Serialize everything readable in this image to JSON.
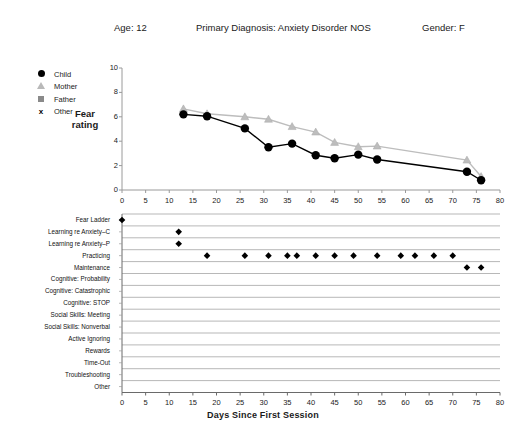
{
  "header": {
    "age": "Age:  12",
    "diagnosis": "Primary Diagnosis:  Anxiety Disorder NOS",
    "gender": "Gender:  F"
  },
  "legend": {
    "items": [
      {
        "label": "Child",
        "marker": "filled-circle",
        "color": "#000000"
      },
      {
        "label": "Mother",
        "marker": "triangle",
        "color": "#bdbdbd"
      },
      {
        "label": "Father",
        "marker": "square",
        "color": "#8a8a8a"
      },
      {
        "label": "Other",
        "marker": "x",
        "color": "#000000"
      }
    ]
  },
  "top_chart": {
    "y_axis_label": "Fear rating"
  },
  "bottom_chart": {
    "rows": [
      "Fear Ladder",
      "Learning re Anxiety–C",
      "Learning re Anxiety–P",
      "Practicing",
      "Maintenance",
      "Cognitive: Probability",
      "Cognitive: Catastrophic",
      "Cognitive: STOP",
      "Social Skills: Meeting",
      "Social Skills: Nonverbal",
      "Active Ignoring",
      "Rewards",
      "Time-Out",
      "Troubleshooting",
      "Other"
    ]
  },
  "xaxis_title": "Days Since First Session",
  "chart_data": [
    {
      "type": "line",
      "title": "",
      "xlabel": "Days Since First Session",
      "ylabel": "Fear rating",
      "xlim": [
        0,
        80
      ],
      "ylim": [
        0,
        10
      ],
      "xticks": [
        0,
        5,
        10,
        15,
        20,
        25,
        30,
        35,
        40,
        45,
        50,
        55,
        60,
        65,
        70,
        75,
        80
      ],
      "yticks": [
        0,
        2,
        4,
        6,
        8,
        10
      ],
      "grid": false,
      "legend_position": "upper-left-outside",
      "series": [
        {
          "name": "Child",
          "marker": "filled-circle",
          "color": "#000000",
          "x": [
            13,
            18,
            26,
            31,
            36,
            41,
            45,
            50,
            54,
            73,
            76
          ],
          "y": [
            6.2,
            6.05,
            5.05,
            3.5,
            3.8,
            2.85,
            2.6,
            2.9,
            2.5,
            1.5,
            0.8
          ]
        },
        {
          "name": "Mother",
          "marker": "triangle",
          "color": "#bdbdbd",
          "x": [
            13,
            18,
            26,
            31,
            36,
            41,
            45,
            50,
            54,
            73,
            76
          ],
          "y": [
            6.65,
            6.25,
            6.0,
            5.8,
            5.2,
            4.75,
            3.9,
            3.55,
            3.6,
            2.45,
            1.1
          ]
        }
      ]
    },
    {
      "type": "scatter",
      "title": "",
      "xlabel": "Days Since First Session",
      "ylabel": "",
      "xlim": [
        0,
        80
      ],
      "xticks": [
        0,
        5,
        10,
        15,
        20,
        25,
        30,
        35,
        40,
        45,
        50,
        55,
        60,
        65,
        70,
        75,
        80
      ],
      "grid": false,
      "marker": "filled-diamond",
      "color": "#000000",
      "categories": [
        "Fear Ladder",
        "Learning re Anxiety–C",
        "Learning re Anxiety–P",
        "Practicing",
        "Maintenance",
        "Cognitive: Probability",
        "Cognitive: Catastrophic",
        "Cognitive: STOP",
        "Social Skills: Meeting",
        "Social Skills: Nonverbal",
        "Active Ignoring",
        "Rewards",
        "Time-Out",
        "Troubleshooting",
        "Other"
      ],
      "points": {
        "Fear Ladder": [
          0
        ],
        "Learning re Anxiety–C": [
          12
        ],
        "Learning re Anxiety–P": [
          12
        ],
        "Practicing": [
          18,
          26,
          31,
          35,
          37,
          41,
          45,
          49,
          54,
          59,
          62,
          66,
          70
        ],
        "Maintenance": [
          73,
          76
        ],
        "Cognitive: Probability": [],
        "Cognitive: Catastrophic": [],
        "Cognitive: STOP": [],
        "Social Skills: Meeting": [],
        "Social Skills: Nonverbal": [],
        "Active Ignoring": [],
        "Rewards": [],
        "Time-Out": [],
        "Troubleshooting": [],
        "Other": []
      }
    }
  ]
}
